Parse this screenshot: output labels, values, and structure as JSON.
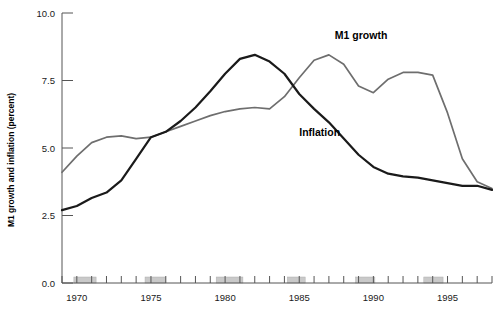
{
  "chart_data": {
    "type": "line",
    "title": "",
    "xlabel": "",
    "ylabel": "M1 growth and inflation (percent)",
    "ylim": [
      0.0,
      10.0
    ],
    "xlim": [
      1969,
      1998
    ],
    "grid": false,
    "legend_position": "inline-annotations",
    "y_ticks": [
      "0.0",
      "2.5",
      "5.0",
      "7.5",
      "10.0"
    ],
    "y_tick_values": [
      0.0,
      2.5,
      5.0,
      7.5,
      10.0
    ],
    "x_ticks": [
      "1970",
      "1975",
      "1980",
      "1985",
      "1990",
      "1995"
    ],
    "x_tick_values": [
      1970,
      1975,
      1980,
      1985,
      1990,
      1995
    ],
    "x_minor_interval": 1,
    "x": [
      1969,
      1970,
      1971,
      1972,
      1973,
      1974,
      1975,
      1976,
      1977,
      1978,
      1979,
      1980,
      1981,
      1982,
      1983,
      1984,
      1985,
      1986,
      1987,
      1988,
      1989,
      1990,
      1991,
      1992,
      1993,
      1994,
      1995,
      1996,
      1997,
      1998
    ],
    "series": [
      {
        "name": "M1 growth",
        "color": "#6e6e6e",
        "label_x": 1987.4,
        "label_y": 9.05,
        "values": [
          4.1,
          4.7,
          5.2,
          5.4,
          5.45,
          5.35,
          5.4,
          5.6,
          5.8,
          6.0,
          6.2,
          6.35,
          6.45,
          6.5,
          6.45,
          6.9,
          7.6,
          8.25,
          8.45,
          8.1,
          7.3,
          7.05,
          7.55,
          7.8,
          7.8,
          7.7,
          6.3,
          4.6,
          3.75,
          3.5
        ]
      },
      {
        "name": "Inflation",
        "color": "#1a1a1a",
        "label_x": 1985.0,
        "label_y": 5.45,
        "values": [
          2.7,
          2.85,
          3.15,
          3.35,
          3.8,
          4.6,
          5.4,
          5.6,
          6.0,
          6.5,
          7.1,
          7.75,
          8.3,
          8.45,
          8.2,
          7.75,
          7.0,
          6.45,
          5.95,
          5.35,
          4.75,
          4.3,
          4.05,
          3.95,
          3.9,
          3.8,
          3.7,
          3.6,
          3.6,
          3.45
        ]
      }
    ],
    "recession_bars": [
      {
        "start": 1969.8,
        "end": 1971.3
      },
      {
        "start": 1974.6,
        "end": 1976.0
      },
      {
        "start": 1979.4,
        "end": 1981.2
      },
      {
        "start": 1984.2,
        "end": 1985.4
      },
      {
        "start": 1988.8,
        "end": 1990.1
      },
      {
        "start": 1993.4,
        "end": 1994.7
      }
    ],
    "colors": {
      "m1_growth_line": "#6e6e6e",
      "inflation_line": "#1a1a1a",
      "recession_bar": "#c9c9c9",
      "axis": "#555555",
      "background": "#ffffff"
    }
  },
  "chart": {
    "y_axis_title": "M1 growth and inflation (percent)",
    "m1_label": "M1 growth",
    "inflation_label": "Inflation"
  }
}
